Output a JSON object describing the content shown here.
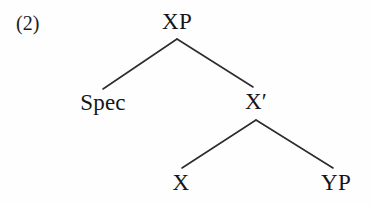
{
  "figure": {
    "example_number": "(2)",
    "kind": "x-bar-syntax-tree",
    "background_color": "#fefefe",
    "line_color": "#2b2b30",
    "text_color": "#15151a"
  },
  "tree": {
    "nodes": {
      "root": "XP",
      "specifier": "Spec",
      "bar_level": "X′",
      "head": "X",
      "complement": "YP"
    },
    "edges": [
      {
        "from": "XP",
        "to": "Spec"
      },
      {
        "from": "XP",
        "to": "X′"
      },
      {
        "from": "X′",
        "to": "X"
      },
      {
        "from": "X′",
        "to": "YP"
      }
    ]
  }
}
